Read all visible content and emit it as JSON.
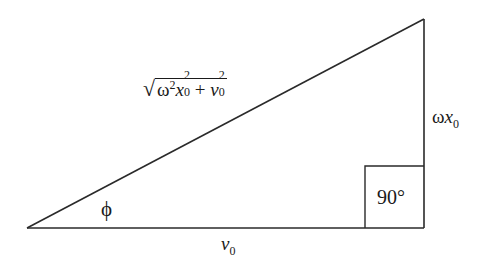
{
  "diagram": {
    "type": "right-triangle",
    "stroke_color": "#2a2a2a",
    "vertices": {
      "left": [
        27,
        228
      ],
      "right_angle": [
        424,
        228
      ],
      "top": [
        424,
        19
      ]
    },
    "right_angle_box": {
      "x": 365,
      "y": 166,
      "width": 59,
      "height": 62,
      "label": "90°"
    },
    "labels": {
      "hypotenuse": {
        "sqrt_symbol": "√",
        "omega": "ω",
        "exp2": "2",
        "x": "x",
        "sub0": "0",
        "plus": "+",
        "v": "v"
      },
      "vertical_side": {
        "omega": "ω",
        "x": "x",
        "sub0": "0"
      },
      "base": {
        "v": "v",
        "sub0": "0"
      },
      "angle": "ϕ"
    }
  }
}
